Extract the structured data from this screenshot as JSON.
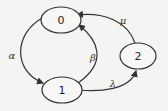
{
  "diagram": {
    "type": "state-transition",
    "nodes": [
      {
        "id": "0",
        "label": "0"
      },
      {
        "id": "1",
        "label": "1"
      },
      {
        "id": "2",
        "label": "2"
      }
    ],
    "edges": [
      {
        "from": "0",
        "to": "1",
        "label": "α"
      },
      {
        "from": "1",
        "to": "0",
        "label": "β"
      },
      {
        "from": "1",
        "to": "2",
        "label": "λ"
      },
      {
        "from": "2",
        "to": "0",
        "label": "μ"
      }
    ]
  }
}
